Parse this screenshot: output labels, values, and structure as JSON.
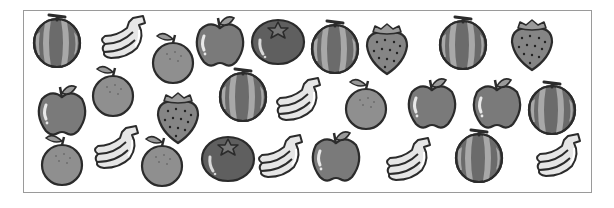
{
  "colors": {
    "outline": "#2b2b2b",
    "melon_dark": "#6b6b6b",
    "melon_light": "#a8a8a8",
    "banana": "#e6e6e6",
    "orange": "#8f8f8f",
    "apple": "#7a7a7a",
    "tomato": "#5f5f5f",
    "strawberry": "#858585",
    "leaf": "#9a9a9a",
    "frame": "#9a9a9a"
  },
  "fruits": [
    {
      "type": "melon",
      "x": 57,
      "y": 41,
      "label": "melon"
    },
    {
      "type": "banana",
      "x": 125,
      "y": 40,
      "label": "banana"
    },
    {
      "type": "orange",
      "x": 173,
      "y": 60,
      "label": "orange"
    },
    {
      "type": "apple",
      "x": 220,
      "y": 42,
      "label": "apple"
    },
    {
      "type": "tomato",
      "x": 278,
      "y": 40,
      "label": "tomato"
    },
    {
      "type": "melon",
      "x": 335,
      "y": 47,
      "label": "melon"
    },
    {
      "type": "strawberry",
      "x": 387,
      "y": 48,
      "label": "strawberry"
    },
    {
      "type": "melon",
      "x": 463,
      "y": 43,
      "label": "melon"
    },
    {
      "type": "strawberry",
      "x": 532,
      "y": 44,
      "label": "strawberry"
    },
    {
      "type": "apple",
      "x": 62,
      "y": 111,
      "label": "apple"
    },
    {
      "type": "orange",
      "x": 113,
      "y": 93,
      "label": "orange"
    },
    {
      "type": "strawberry",
      "x": 178,
      "y": 117,
      "label": "strawberry"
    },
    {
      "type": "melon",
      "x": 243,
      "y": 95,
      "label": "melon"
    },
    {
      "type": "banana",
      "x": 300,
      "y": 102,
      "label": "banana"
    },
    {
      "type": "orange",
      "x": 366,
      "y": 106,
      "label": "orange"
    },
    {
      "type": "apple",
      "x": 432,
      "y": 104,
      "label": "apple"
    },
    {
      "type": "apple",
      "x": 497,
      "y": 104,
      "label": "apple"
    },
    {
      "type": "melon",
      "x": 552,
      "y": 108,
      "label": "melon"
    },
    {
      "type": "orange",
      "x": 62,
      "y": 162,
      "label": "orange"
    },
    {
      "type": "banana",
      "x": 118,
      "y": 150,
      "label": "banana"
    },
    {
      "type": "orange",
      "x": 162,
      "y": 163,
      "label": "orange"
    },
    {
      "type": "tomato",
      "x": 228,
      "y": 157,
      "label": "tomato"
    },
    {
      "type": "banana",
      "x": 282,
      "y": 159,
      "label": "banana"
    },
    {
      "type": "apple",
      "x": 336,
      "y": 157,
      "label": "apple"
    },
    {
      "type": "banana",
      "x": 410,
      "y": 162,
      "label": "banana"
    },
    {
      "type": "melon",
      "x": 479,
      "y": 156,
      "label": "melon"
    },
    {
      "type": "banana",
      "x": 560,
      "y": 158,
      "label": "banana"
    }
  ]
}
